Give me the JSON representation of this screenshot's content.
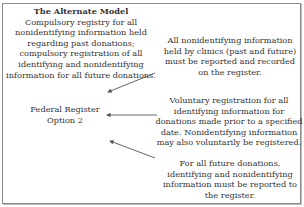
{
  "diagram": {
    "header": {
      "title": "The Alternate Model",
      "body": "Compulsory registry for all nonidentifying information held regarding past donations; compulsory registration of all identifying and nonidentifying information for all future donations."
    },
    "center_node": {
      "line1": "Federal Register",
      "line2": "Option 2"
    },
    "notes": [
      {
        "text": "All nonidentifying information held by clinics (past and future) must be reported and recorded on the register."
      },
      {
        "text": "Voluntary registration for all identifying information for donations made prior to a specified date. Nonidentifying information may also voluntarily be registered."
      },
      {
        "text": "For all future donations, identifying and nonidentifying information must be reported to the register."
      }
    ],
    "colors": {
      "border": "#8a8a8a",
      "arrow": "#555555",
      "text": "#333333"
    }
  }
}
